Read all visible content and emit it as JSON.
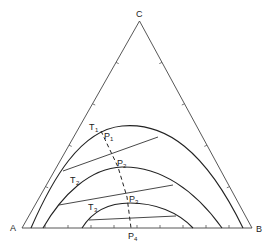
{
  "diagram": {
    "type": "ternary-phase-diagram",
    "vertices": {
      "top": "C",
      "left": "A",
      "right": "B"
    },
    "isotherms": [
      {
        "label": "T",
        "sub": "1"
      },
      {
        "label": "T",
        "sub": "2"
      },
      {
        "label": "T",
        "sub": "3"
      }
    ],
    "plait_points": [
      {
        "label": "P",
        "sub": "1"
      },
      {
        "label": "P",
        "sub": "2"
      },
      {
        "label": "P",
        "sub": "3"
      },
      {
        "label": "P",
        "sub": "4"
      }
    ],
    "colors": {
      "line": "#222222",
      "background": "#ffffff"
    }
  }
}
